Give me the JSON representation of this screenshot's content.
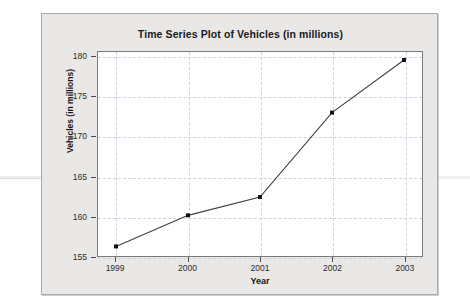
{
  "chart_data": {
    "type": "line",
    "title": "Time Series Plot of Vehicles (in millions)",
    "xlabel": "Year",
    "ylabel": "Vehicles  (in millions)",
    "categories": [
      "1999",
      "2000",
      "2001",
      "2002",
      "2003"
    ],
    "x": [
      1999,
      2000,
      2001,
      2002,
      2003
    ],
    "values": [
      156.2,
      160.1,
      162.4,
      173.0,
      179.6
    ],
    "series": [
      {
        "name": "Vehicles",
        "values": [
          156.2,
          160.1,
          162.4,
          173.0,
          179.6
        ]
      }
    ],
    "ylim": [
      155,
      180.6
    ],
    "xlim": [
      1998.75,
      2003.25
    ],
    "yticks": [
      155,
      160,
      165,
      170,
      175,
      180
    ],
    "ytick_labels": [
      "155",
      "160",
      "165",
      "170",
      "175",
      "180"
    ],
    "xticks": [
      1999,
      2000,
      2001,
      2002,
      2003
    ],
    "xtick_labels": [
      "1999",
      "2000",
      "2001",
      "2002",
      "2003"
    ],
    "grid": true,
    "grid_style": "dashed",
    "legend": false,
    "marker": "square",
    "line_color": "#3f3f3f",
    "marker_color": "#101010",
    "grid_color": "#c9d4e0",
    "plot_background": "#ffffff",
    "panel_background": "#e9e8e6"
  }
}
